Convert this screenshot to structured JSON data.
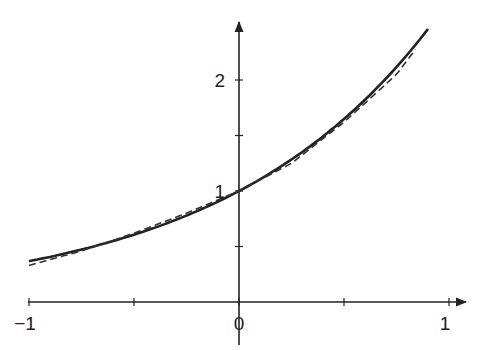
{
  "chart_data": {
    "type": "line",
    "title": "",
    "xlabel": "",
    "ylabel": "",
    "xlim": [
      -1,
      1.05
    ],
    "ylim": [
      0,
      2.8
    ],
    "x_ticks": [
      -1,
      -0.5,
      0,
      0.5,
      1
    ],
    "x_tick_labels": [
      "−1",
      "",
      "0",
      "",
      "1"
    ],
    "y_ticks": [
      0.5,
      1,
      1.5,
      2
    ],
    "y_tick_labels": [
      "",
      "1",
      "",
      "2"
    ],
    "grid": false,
    "legend": null,
    "series": [
      {
        "name": "f(x) = e^x",
        "style": "solid",
        "x": [
          -1,
          -0.75,
          -0.5,
          -0.25,
          0,
          0.25,
          0.5,
          0.75,
          0.9
        ],
        "y": [
          0.368,
          0.472,
          0.607,
          0.779,
          1.0,
          1.284,
          1.649,
          2.117,
          2.46
        ]
      },
      {
        "name": "approximation",
        "style": "dashed",
        "x": [
          -1,
          -0.75,
          -0.5,
          -0.25,
          0,
          0.25,
          0.5,
          0.75,
          0.85
        ],
        "y": [
          0.33,
          0.46,
          0.62,
          0.8,
          1.0,
          1.25,
          1.62,
          2.05,
          2.3
        ]
      }
    ]
  }
}
